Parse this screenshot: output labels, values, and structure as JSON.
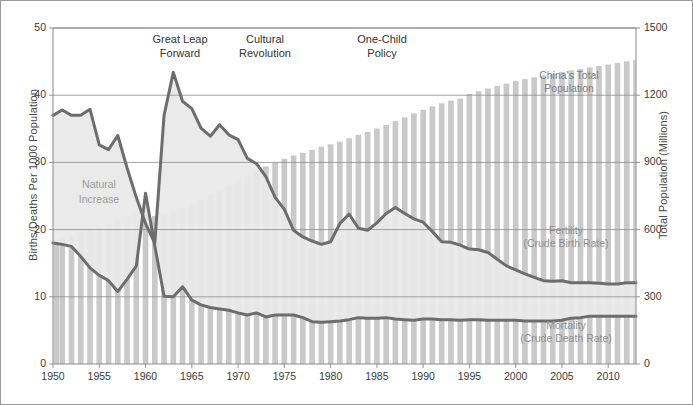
{
  "figure": {
    "border_color": "#9a9a9a",
    "bg": "#ffffff"
  },
  "chart_data": {
    "type": "line",
    "title": "",
    "subtitle": "",
    "xlabel": "",
    "ylabel": "Births/Deaths Per 1000 Population",
    "y2label": "Total Population (Millions)",
    "xlim": [
      1950,
      2013
    ],
    "ylim": [
      0,
      50
    ],
    "y2lim": [
      0,
      1500
    ],
    "grid": true,
    "grid_axis": "y",
    "legend": "inline-annotations",
    "xticks": [
      1950,
      1955,
      1960,
      1965,
      1970,
      1975,
      1980,
      1985,
      1990,
      1995,
      2000,
      2005,
      2010
    ],
    "yticks_left": [
      0,
      10,
      20,
      30,
      40,
      50
    ],
    "yticks_right": [
      0,
      300,
      600,
      900,
      1200,
      1500
    ],
    "x": [
      1950,
      1951,
      1952,
      1953,
      1954,
      1955,
      1956,
      1957,
      1958,
      1959,
      1960,
      1961,
      1962,
      1963,
      1964,
      1965,
      1966,
      1967,
      1968,
      1969,
      1970,
      1971,
      1972,
      1973,
      1974,
      1975,
      1976,
      1977,
      1978,
      1979,
      1980,
      1981,
      1982,
      1983,
      1984,
      1985,
      1986,
      1987,
      1988,
      1989,
      1990,
      1991,
      1992,
      1993,
      1994,
      1995,
      1996,
      1997,
      1998,
      1999,
      2000,
      2001,
      2002,
      2003,
      2004,
      2005,
      2006,
      2007,
      2008,
      2009,
      2010,
      2011,
      2012,
      2013
    ],
    "series": [
      {
        "name": "Fertility (Crude Birth Rate)",
        "unit": "per 1000 population",
        "axis": "left",
        "color": "#6d6d6d",
        "values": [
          37.0,
          37.8,
          37.0,
          37.0,
          37.9,
          32.6,
          31.9,
          34.0,
          29.2,
          24.8,
          20.9,
          18.0,
          37.0,
          43.4,
          39.1,
          38.0,
          35.1,
          33.9,
          35.6,
          34.1,
          33.4,
          30.6,
          29.8,
          27.9,
          24.8,
          23.0,
          19.9,
          18.9,
          18.3,
          17.8,
          18.2,
          20.9,
          22.3,
          20.2,
          19.9,
          21.0,
          22.4,
          23.3,
          22.4,
          21.6,
          21.1,
          19.7,
          18.2,
          18.1,
          17.7,
          17.1,
          17.0,
          16.6,
          15.6,
          14.6,
          14.0,
          13.4,
          12.9,
          12.4,
          12.3,
          12.4,
          12.1,
          12.1,
          12.1,
          12.0,
          11.9,
          11.9,
          12.1,
          12.1
        ]
      },
      {
        "name": "Mortality (Crude Death Rate)",
        "unit": "per 1000 population",
        "axis": "left",
        "color": "#6d6d6d",
        "values": [
          18.0,
          17.8,
          17.5,
          16.0,
          14.3,
          13.2,
          12.4,
          10.8,
          12.6,
          14.6,
          25.4,
          17.6,
          10.1,
          10.0,
          11.5,
          9.5,
          8.8,
          8.4,
          8.2,
          8.0,
          7.6,
          7.3,
          7.6,
          7.0,
          7.3,
          7.3,
          7.3,
          6.9,
          6.3,
          6.2,
          6.3,
          6.4,
          6.6,
          6.9,
          6.8,
          6.8,
          6.9,
          6.7,
          6.6,
          6.5,
          6.7,
          6.7,
          6.6,
          6.6,
          6.5,
          6.6,
          6.6,
          6.5,
          6.5,
          6.5,
          6.5,
          6.4,
          6.4,
          6.4,
          6.4,
          6.5,
          6.8,
          6.9,
          7.1,
          7.1,
          7.1,
          7.1,
          7.1,
          7.1
        ]
      },
      {
        "name": "China's Total Population",
        "unit": "millions",
        "axis": "right",
        "type": "bar",
        "color": "#c9c9c9",
        "values": [
          552,
          563,
          575,
          588,
          603,
          615,
          628,
          647,
          660,
          672,
          667,
          660,
          666,
          682,
          699,
          715,
          735,
          755,
          775,
          797,
          818,
          841,
          862,
          882,
          900,
          916,
          931,
          943,
          956,
          970,
          981,
          993,
          1008,
          1023,
          1036,
          1051,
          1067,
          1084,
          1101,
          1119,
          1135,
          1150,
          1164,
          1176,
          1185,
          1205,
          1218,
          1230,
          1241,
          1252,
          1263,
          1272,
          1280,
          1288,
          1296,
          1304,
          1311,
          1317,
          1324,
          1331,
          1337,
          1344,
          1351,
          1357
        ]
      }
    ],
    "filled_region": {
      "name": "Natural Increase",
      "between": [
        "Fertility (Crude Birth Rate)",
        "Mortality (Crude Death Rate)"
      ],
      "color": "#e9e9e9"
    }
  },
  "axes": {
    "left_title": "Births/Deaths Per 1000 Population",
    "right_title": "Total Population (Millions)",
    "x_tick_labels": [
      "1950",
      "1955",
      "1960",
      "1965",
      "1970",
      "1975",
      "1980",
      "1985",
      "1990",
      "1995",
      "2000",
      "2005",
      "2010"
    ],
    "y_left_labels": [
      "0",
      "10",
      "20",
      "30",
      "40",
      "50"
    ],
    "y_right_labels": [
      "0",
      "300",
      "600",
      "900",
      "1200",
      "1500"
    ]
  },
  "annotations": [
    {
      "id": "great-leap-forward",
      "line1": "Great Leap",
      "line2": "Forward",
      "x_px": 124,
      "y_px": 32
    },
    {
      "id": "cultural-revolution",
      "line1": "Cultural",
      "line2": "Revolution",
      "x_px": 209,
      "y_px": 32
    },
    {
      "id": "one-child-policy",
      "line1": "One-Child",
      "line2": "Policy",
      "x_px": 326,
      "y_px": 32
    }
  ],
  "inline_labels": {
    "natural_increase": {
      "line1": "Natural",
      "line2": "Increase",
      "x_px": 58,
      "y_px": 176
    },
    "total_population": {
      "line1": "China's Total",
      "line2": "Population",
      "x_px": 503,
      "y_px": 68
    },
    "fertility": {
      "line1": "Fertility",
      "line2": "(Crude Birth Rate)",
      "x_px": 500,
      "y_px": 223
    },
    "mortality": {
      "line1": "Mortality",
      "line2": "(Crude Death Rate)",
      "x_px": 500,
      "y_px": 318
    }
  },
  "colors": {
    "line": "#6d6d6d",
    "bar": "#c9c9c9",
    "natural_increase_fill": "#e9e9e9",
    "grid": "#8a8a8a",
    "plot_border": "#8a8a8a",
    "text": "#3a3a3a",
    "muted_text": "#9b9b9b"
  }
}
